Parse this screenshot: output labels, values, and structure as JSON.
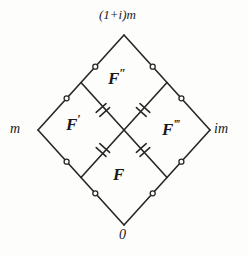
{
  "figure": {
    "kind": "geometric-diagram",
    "stroke_color": "#262626",
    "background_color": "#fdfdfb"
  },
  "vertices": {
    "top": {
      "label": "(1+i)m",
      "x": 124,
      "y": 35
    },
    "left": {
      "label": "m",
      "x": 38,
      "y": 130
    },
    "right": {
      "label": "im",
      "x": 210,
      "y": 130
    },
    "bottom": {
      "label": "0",
      "x": 124,
      "y": 225
    }
  },
  "regions": {
    "top": {
      "base": "F",
      "primes": "″"
    },
    "left": {
      "base": "F",
      "primes": "′"
    },
    "right": {
      "base": "F",
      "primes": "‴"
    },
    "bottom": {
      "base": "F",
      "primes": ""
    }
  },
  "marks": {
    "outer_edge_mark": "ring",
    "inner_edge_mark": "double-hatch",
    "outer_ring_count": 8,
    "inner_hatch_count": 4
  }
}
